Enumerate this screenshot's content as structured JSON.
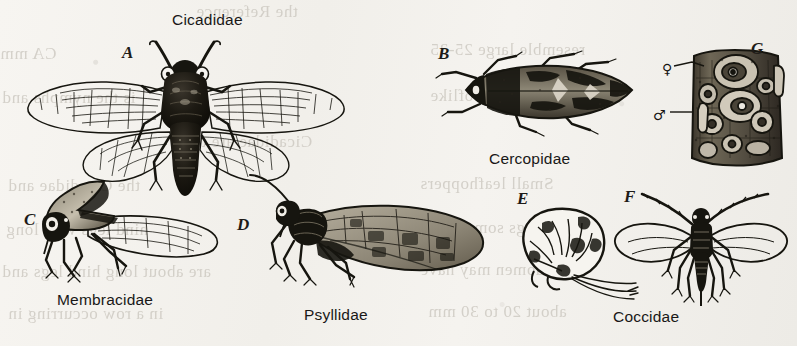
{
  "plate": {
    "title": "Hemiptera family representatives figure plate",
    "background_color": "#f3f1ed",
    "ink_color": "#16150f",
    "width": 797,
    "height": 346
  },
  "figure_letters": [
    {
      "id": "A",
      "label": "A",
      "x": 122,
      "y": 44
    },
    {
      "id": "B",
      "label": "B",
      "x": 438,
      "y": 45
    },
    {
      "id": "C",
      "label": "C",
      "x": 24,
      "y": 211
    },
    {
      "id": "D",
      "label": "D",
      "x": 237,
      "y": 216
    },
    {
      "id": "E",
      "label": "E",
      "x": 517,
      "y": 190
    },
    {
      "id": "F",
      "label": "F",
      "x": 624,
      "y": 188
    },
    {
      "id": "G",
      "label": "G",
      "x": 751,
      "y": 40
    }
  ],
  "family_labels": [
    {
      "id": "cicadidae",
      "label": "Cicadidae",
      "x": 172,
      "y": 12
    },
    {
      "id": "cercopidae",
      "label": "Cercopidae",
      "x": 489,
      "y": 151
    },
    {
      "id": "membracidae",
      "label": "Membracidae",
      "x": 57,
      "y": 292
    },
    {
      "id": "psyllidae",
      "label": "Psyllidae",
      "x": 304,
      "y": 307
    },
    {
      "id": "coccidae",
      "label": "Coccidae",
      "x": 613,
      "y": 309
    }
  ],
  "sex_symbols": [
    {
      "id": "female",
      "label": "♀",
      "x": 662,
      "y": 62
    },
    {
      "id": "male",
      "label": "♂",
      "x": 653,
      "y": 108
    }
  ],
  "ghost_text": [
    {
      "text": "the Reference",
      "x": 196,
      "y": 2
    },
    {
      "text": "CA mm",
      "x": 0,
      "y": 44
    },
    {
      "text": "resemble large 25-35",
      "x": 430,
      "y": 40
    },
    {
      "text": "is the nymphs and",
      "x": 2,
      "y": 88
    },
    {
      "text": "wings held rooflike",
      "x": 430,
      "y": 86
    },
    {
      "text": "Cicadidae are the",
      "x": 184,
      "y": 132
    },
    {
      "text": "the Cicadidae and",
      "x": 8,
      "y": 176
    },
    {
      "text": "Small leafhoppers",
      "x": 420,
      "y": 174
    },
    {
      "text": "hind legs with long",
      "x": 6,
      "y": 220
    },
    {
      "text": "wings somewhat",
      "x": 430,
      "y": 218
    },
    {
      "text": "are about long hind legs and",
      "x": 2,
      "y": 262
    },
    {
      "text": "abdomen may have",
      "x": 420,
      "y": 260
    },
    {
      "text": "in a row occurring in",
      "x": 8,
      "y": 304
    },
    {
      "text": "about 20 to 30 mm",
      "x": 428,
      "y": 302
    }
  ]
}
